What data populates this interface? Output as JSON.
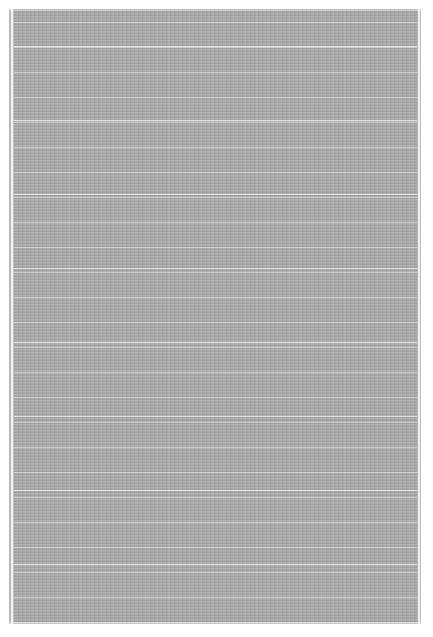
{
  "image": {
    "subject": "gray textured rug with light grid lines",
    "background_color": "#ffffff",
    "rug": {
      "base_color": "#a9a9a9",
      "line_color": "#ebebeb",
      "bounds": {
        "left": 9,
        "top": 9,
        "width": 412,
        "height": 615
      },
      "horizontal_line_spacing_px": 12,
      "vertical_line_spacing_px": 41
    }
  }
}
